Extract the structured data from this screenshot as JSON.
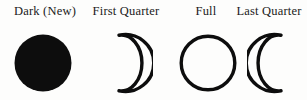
{
  "figure": {
    "title_present": false,
    "background_color": "#fdfdfc",
    "ink_color": "#111111",
    "phases": [
      {
        "label": "Dark (New)",
        "icon": "new-moon-filled-circle",
        "shape": "filled-circle",
        "illumination_percent": 0
      },
      {
        "label": "First Quarter",
        "icon": "first-quarter-crescent-outline",
        "shape": "crescent-outline-right",
        "illumination_percent": 50
      },
      {
        "label": "Full",
        "icon": "full-moon-circle-outline",
        "shape": "circle-outline",
        "illumination_percent": 100
      },
      {
        "label": "Last Quarter",
        "icon": "last-quarter-crescent-outline",
        "shape": "crescent-outline-left",
        "illumination_percent": 50
      }
    ]
  }
}
